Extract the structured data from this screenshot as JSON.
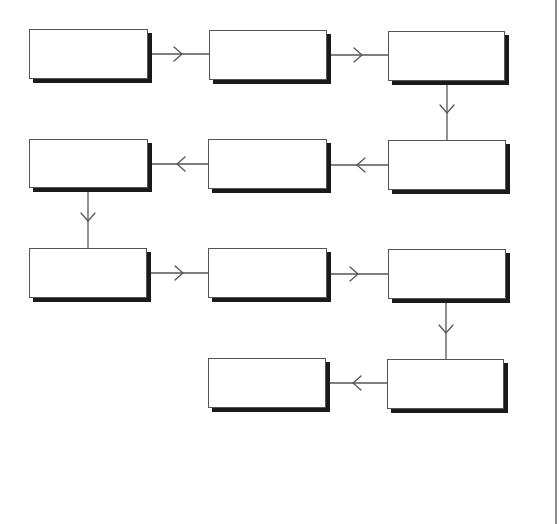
{
  "diagram": {
    "type": "flowchart",
    "layout": "serpentine",
    "colors": {
      "background": "#ffffff",
      "box_fill": "#ffffff",
      "box_border": "#555555",
      "box_shadow": "#1a1a1a",
      "connector": "#555555",
      "right_rule": "#8a8a8a"
    },
    "nodes": [
      {
        "id": "n1",
        "label": "",
        "row": 1,
        "col": 1,
        "x": 29,
        "y": 29,
        "w": 119,
        "h": 50
      },
      {
        "id": "n2",
        "label": "",
        "row": 1,
        "col": 2,
        "x": 209,
        "y": 30,
        "w": 118,
        "h": 50
      },
      {
        "id": "n3",
        "label": "",
        "row": 1,
        "col": 3,
        "x": 388,
        "y": 31,
        "w": 117,
        "h": 50
      },
      {
        "id": "n4",
        "label": "",
        "row": 2,
        "col": 3,
        "x": 388,
        "y": 140,
        "w": 118,
        "h": 50
      },
      {
        "id": "n5",
        "label": "",
        "row": 2,
        "col": 2,
        "x": 208,
        "y": 139,
        "w": 119,
        "h": 50
      },
      {
        "id": "n6",
        "label": "",
        "row": 2,
        "col": 1,
        "x": 29,
        "y": 139,
        "w": 119,
        "h": 49
      },
      {
        "id": "n7",
        "label": "",
        "row": 3,
        "col": 1,
        "x": 29,
        "y": 248,
        "w": 118,
        "h": 50
      },
      {
        "id": "n8",
        "label": "",
        "row": 3,
        "col": 2,
        "x": 208,
        "y": 248,
        "w": 119,
        "h": 50
      },
      {
        "id": "n9",
        "label": "",
        "row": 3,
        "col": 3,
        "x": 388,
        "y": 249,
        "w": 118,
        "h": 50
      },
      {
        "id": "n10",
        "label": "",
        "row": 4,
        "col": 3,
        "x": 387,
        "y": 359,
        "w": 117,
        "h": 50
      },
      {
        "id": "n11",
        "label": "",
        "row": 4,
        "col": 2,
        "x": 208,
        "y": 358,
        "w": 118,
        "h": 50
      }
    ],
    "edges": [
      {
        "from": "n1",
        "to": "n2",
        "direction": "right"
      },
      {
        "from": "n2",
        "to": "n3",
        "direction": "right"
      },
      {
        "from": "n3",
        "to": "n4",
        "direction": "down"
      },
      {
        "from": "n4",
        "to": "n5",
        "direction": "left"
      },
      {
        "from": "n5",
        "to": "n6",
        "direction": "left"
      },
      {
        "from": "n6",
        "to": "n7",
        "direction": "down"
      },
      {
        "from": "n7",
        "to": "n8",
        "direction": "right"
      },
      {
        "from": "n8",
        "to": "n9",
        "direction": "right"
      },
      {
        "from": "n9",
        "to": "n10",
        "direction": "down"
      },
      {
        "from": "n10",
        "to": "n11",
        "direction": "left"
      }
    ]
  }
}
